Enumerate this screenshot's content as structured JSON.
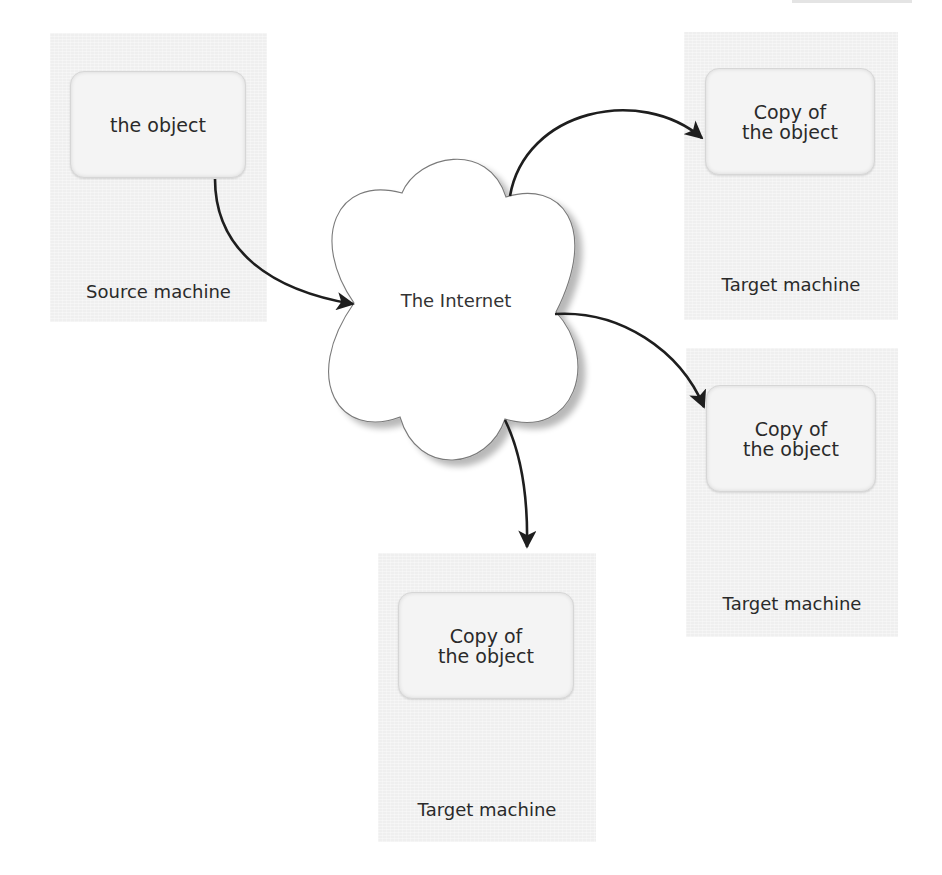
{
  "diagram": {
    "type": "network-replication",
    "source": {
      "panel_label": "Source machine",
      "object_label": "the object"
    },
    "network": {
      "label": "The Internet",
      "shape": "cloud"
    },
    "targets": [
      {
        "panel_label": "Target machine",
        "object_line1": "Copy of",
        "object_line2": "the object",
        "position": "top-right"
      },
      {
        "panel_label": "Target machine",
        "object_line1": "Copy of",
        "object_line2": "the object",
        "position": "middle-right"
      },
      {
        "panel_label": "Target machine",
        "object_line1": "Copy of",
        "object_line2": "the object",
        "position": "bottom-center"
      }
    ],
    "edges": [
      {
        "from": "the object (Source machine)",
        "to": "The Internet"
      },
      {
        "from": "The Internet",
        "to": "Copy of the object (top-right Target machine)"
      },
      {
        "from": "The Internet",
        "to": "Copy of the object (middle-right Target machine)"
      },
      {
        "from": "The Internet",
        "to": "Copy of the object (bottom Target machine)"
      }
    ],
    "colors": {
      "panel": "#efefef",
      "object_box": "#f4f4f4",
      "arrow": "#1e1e1e",
      "cloud_fill": "#ffffff",
      "cloud_stroke": "#7a7a7a"
    }
  }
}
